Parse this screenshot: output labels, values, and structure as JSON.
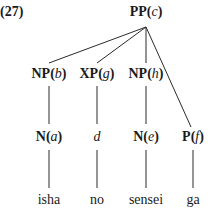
{
  "example_number": "(27)",
  "tree": {
    "root": {
      "category": "PP",
      "variable": "c"
    },
    "level2": [
      {
        "category": "NP",
        "variable": "b"
      },
      {
        "category": "XP",
        "variable": "g"
      },
      {
        "category": "NP",
        "variable": "h"
      }
    ],
    "level3": [
      {
        "category": "N",
        "variable": "a"
      },
      {
        "category": "",
        "variable": "d"
      },
      {
        "category": "N",
        "variable": "e"
      },
      {
        "category": "P",
        "variable": "f"
      }
    ],
    "words": [
      "isha",
      "no",
      "sensei",
      "ga"
    ]
  },
  "colors": {
    "line": "#2a2a2a",
    "text": "#1a1a1a"
  }
}
